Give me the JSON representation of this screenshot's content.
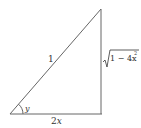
{
  "diagram": {
    "type": "right-triangle",
    "hypotenuse_label": "1",
    "base_label": "2x",
    "base_coeff": "2",
    "base_var": "x",
    "height_label": "√(1 − 4x²)",
    "height_radicand": "1 − 4x",
    "height_exponent": "2",
    "angle_label": "y",
    "stroke_color": "#555555"
  }
}
